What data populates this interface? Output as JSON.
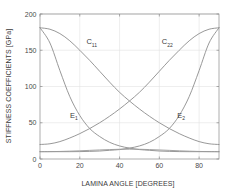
{
  "chart_data": {
    "type": "line",
    "title": "",
    "xlabel": "LAMINA ANGLE [DEGREES]",
    "ylabel": "STIFFNESS COEFFICIENTS [GPa]",
    "xlim": [
      0,
      90
    ],
    "ylim": [
      0,
      200
    ],
    "xticks": [
      0,
      20,
      40,
      60,
      80
    ],
    "yticks": [
      0,
      50,
      100,
      150,
      200
    ],
    "xtick_labels": [
      "0",
      "20",
      "40",
      "60",
      "80"
    ],
    "ytick_labels": [
      "0",
      "50",
      "100",
      "150",
      "200"
    ],
    "grid": true,
    "legend": "none",
    "x": [
      0,
      5,
      10,
      15,
      20,
      25,
      30,
      35,
      40,
      45,
      50,
      55,
      60,
      65,
      70,
      75,
      80,
      85,
      90
    ],
    "series": [
      {
        "name": "C11",
        "label": "C",
        "subscript": "11",
        "color": "#8c8c8c",
        "label_x": 26,
        "label_y": 158,
        "values": [
          181,
          179,
          173,
          163,
          150,
          136,
          121,
          106,
          92,
          80,
          69,
          59,
          50,
          42,
          35,
          29,
          24,
          21,
          20
        ]
      },
      {
        "name": "C22",
        "label": "C",
        "subscript": "22",
        "color": "#8c8c8c",
        "label_x": 64,
        "label_y": 158,
        "values": [
          20,
          21,
          24,
          29,
          35,
          42,
          50,
          59,
          69,
          80,
          92,
          106,
          121,
          136,
          150,
          163,
          173,
          179,
          181
        ]
      },
      {
        "name": "E1",
        "label": "E",
        "subscript": "1",
        "color": "#8c8c8c",
        "label_x": 17,
        "label_y": 57,
        "values": [
          181,
          160,
          122,
          86,
          60,
          42,
          31,
          23,
          18,
          15,
          13,
          12,
          11,
          10.5,
          10.2,
          10.1,
          10.1,
          10.1,
          10.1
        ]
      },
      {
        "name": "E2",
        "label": "E",
        "subscript": "2",
        "color": "#8c8c8c",
        "label_x": 71,
        "label_y": 57,
        "values": [
          10.1,
          10.1,
          10.1,
          10.1,
          10.2,
          10.5,
          11,
          12,
          13,
          15,
          18,
          23,
          31,
          42,
          60,
          86,
          122,
          160,
          181
        ]
      },
      {
        "name": "baseline",
        "label": "",
        "subscript": "",
        "color": "#9a9a9a",
        "label_x": -100,
        "label_y": -100,
        "values": [
          10.1,
          10.2,
          10.4,
          10.8,
          11.3,
          11.9,
          12.5,
          13,
          13.4,
          13.5,
          13.4,
          13,
          12.5,
          11.9,
          11.3,
          10.8,
          10.4,
          10.2,
          10.1
        ]
      }
    ]
  }
}
